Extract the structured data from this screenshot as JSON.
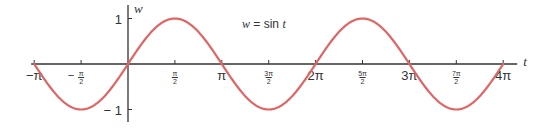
{
  "chart_data": {
    "type": "line",
    "title": "",
    "annotation": "w = sin t",
    "xlabel": "t",
    "ylabel": "w",
    "function": "sin",
    "xlim_pi": [
      -1,
      4
    ],
    "ylim": [
      -1,
      1
    ],
    "grid": false,
    "legend": "none",
    "x_ticks": [
      {
        "value_pi": -1,
        "label": "−π",
        "style": "big"
      },
      {
        "value_pi": -0.5,
        "label_num": "π",
        "label_den": "2",
        "sign": "−",
        "style": "frac"
      },
      {
        "value_pi": 0.5,
        "label_num": "π",
        "label_den": "2",
        "sign": "",
        "style": "frac"
      },
      {
        "value_pi": 1,
        "label": "π",
        "style": "big"
      },
      {
        "value_pi": 1.5,
        "label_num": "3π",
        "label_den": "2",
        "sign": "",
        "style": "frac"
      },
      {
        "value_pi": 2,
        "label": "2π",
        "style": "big"
      },
      {
        "value_pi": 2.5,
        "label_num": "5π",
        "label_den": "2",
        "sign": "",
        "style": "frac"
      },
      {
        "value_pi": 3,
        "label": "3π",
        "style": "big"
      },
      {
        "value_pi": 3.5,
        "label_num": "7π",
        "label_den": "2",
        "sign": "",
        "style": "frac"
      },
      {
        "value_pi": 4,
        "label": "4π",
        "style": "big"
      }
    ],
    "y_ticks": [
      {
        "value": 1,
        "label": "1"
      },
      {
        "value": -1,
        "label": "− 1"
      }
    ],
    "series": [
      {
        "name": "w = sin t",
        "color": "#e06666",
        "x_start_pi": -1,
        "x_end_pi": 4,
        "key_points": [
          {
            "t_pi": -1,
            "w": 0
          },
          {
            "t_pi": -0.5,
            "w": -1
          },
          {
            "t_pi": 0,
            "w": 0
          },
          {
            "t_pi": 0.5,
            "w": 1
          },
          {
            "t_pi": 1,
            "w": 0
          },
          {
            "t_pi": 1.5,
            "w": -1
          },
          {
            "t_pi": 2,
            "w": 0
          },
          {
            "t_pi": 2.5,
            "w": 1
          },
          {
            "t_pi": 3,
            "w": 0
          },
          {
            "t_pi": 3.5,
            "w": -1
          },
          {
            "t_pi": 4,
            "w": 0
          }
        ]
      }
    ]
  },
  "colors": {
    "axis": "#333333",
    "curve": "#e06666"
  }
}
